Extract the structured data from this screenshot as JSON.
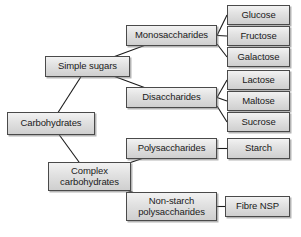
{
  "diagram": {
    "type": "tree-diagram",
    "background_color": "#ffffff",
    "node_fill_top": "#f2f2f2",
    "node_fill_bottom": "#cfcfcf",
    "node_border_color": "#4a4a4a",
    "connector_color": "#1a1a1a",
    "nodes": [
      {
        "id": "carbohydrates",
        "label": "Carbohydrates",
        "level": 0,
        "x": 7,
        "y": 112,
        "w": 88,
        "h": 23
      },
      {
        "id": "simple-sugars",
        "label": "Simple sugars",
        "level": 1,
        "x": 45,
        "y": 56,
        "w": 85,
        "h": 21
      },
      {
        "id": "complex-carbohydrates",
        "label": "Complex\ncarbohydrates",
        "level": 1,
        "x": 48,
        "y": 162,
        "w": 83,
        "h": 29
      },
      {
        "id": "monosaccharides",
        "label": "Monosaccharides",
        "level": 2,
        "x": 126,
        "y": 25,
        "w": 91,
        "h": 21
      },
      {
        "id": "disaccharides",
        "label": "Disaccharides",
        "level": 2,
        "x": 126,
        "y": 87,
        "w": 91,
        "h": 21
      },
      {
        "id": "polysaccharides",
        "label": "Polysaccharides",
        "level": 2,
        "x": 126,
        "y": 138,
        "w": 91,
        "h": 21
      },
      {
        "id": "non-starch-polysaccharides",
        "label": "Non-starch\npolysaccharides",
        "level": 2,
        "x": 126,
        "y": 192,
        "w": 91,
        "h": 29
      },
      {
        "id": "glucose",
        "label": "Glucose",
        "level": 3,
        "x": 227,
        "y": 5,
        "w": 63,
        "h": 20
      },
      {
        "id": "fructose",
        "label": "Fructose",
        "level": 3,
        "x": 227,
        "y": 26,
        "w": 63,
        "h": 20
      },
      {
        "id": "galactose",
        "label": "Galactose",
        "level": 3,
        "x": 227,
        "y": 47,
        "w": 63,
        "h": 20
      },
      {
        "id": "lactose",
        "label": "Lactose",
        "level": 3,
        "x": 227,
        "y": 70,
        "w": 63,
        "h": 20
      },
      {
        "id": "maltose",
        "label": "Maltose",
        "level": 3,
        "x": 227,
        "y": 91,
        "w": 63,
        "h": 20
      },
      {
        "id": "sucrose",
        "label": "Sucrose",
        "level": 3,
        "x": 227,
        "y": 112,
        "w": 63,
        "h": 20
      },
      {
        "id": "starch",
        "label": "Starch",
        "level": 3,
        "x": 227,
        "y": 138,
        "w": 63,
        "h": 21
      },
      {
        "id": "fibre-nsp",
        "label": "Fibre NSP",
        "level": 3,
        "x": 225,
        "y": 196,
        "w": 65,
        "h": 21
      }
    ],
    "edges": [
      {
        "from": "carbohydrates",
        "to": "simple-sugars"
      },
      {
        "from": "carbohydrates",
        "to": "complex-carbohydrates"
      },
      {
        "from": "simple-sugars",
        "to": "monosaccharides"
      },
      {
        "from": "simple-sugars",
        "to": "disaccharides"
      },
      {
        "from": "complex-carbohydrates",
        "to": "polysaccharides"
      },
      {
        "from": "complex-carbohydrates",
        "to": "non-starch-polysaccharides"
      },
      {
        "from": "monosaccharides",
        "to": "glucose"
      },
      {
        "from": "monosaccharides",
        "to": "fructose"
      },
      {
        "from": "monosaccharides",
        "to": "galactose"
      },
      {
        "from": "disaccharides",
        "to": "lactose"
      },
      {
        "from": "disaccharides",
        "to": "maltose"
      },
      {
        "from": "disaccharides",
        "to": "sucrose"
      },
      {
        "from": "polysaccharides",
        "to": "starch"
      },
      {
        "from": "non-starch-polysaccharides",
        "to": "fibre-nsp"
      }
    ]
  }
}
